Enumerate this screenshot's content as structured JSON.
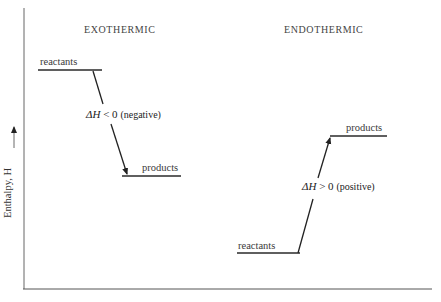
{
  "diagram": {
    "type": "enthalpy-level-diagram",
    "y_axis_label": "Enthalpy, H",
    "panels": [
      {
        "title": "EXOTHERMIC",
        "upper_level_label": "reactants",
        "lower_level_label": "products",
        "delta_h_prefix": "ΔH",
        "delta_h_relation": "< 0",
        "delta_h_note": "(negative)",
        "arrow_direction": "down"
      },
      {
        "title": "ENDOTHERMIC",
        "upper_level_label": "products",
        "lower_level_label": "reactants",
        "delta_h_prefix": "ΔH",
        "delta_h_relation": "> 0",
        "delta_h_note": "(positive)",
        "arrow_direction": "up"
      }
    ]
  },
  "colors": {
    "line": "#2a2a2a",
    "axis": "#555555",
    "background": "#ffffff"
  }
}
